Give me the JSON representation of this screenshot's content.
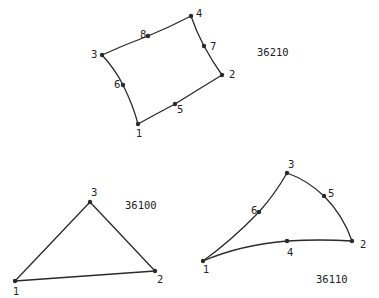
{
  "elements": {
    "quad": {
      "id_label": "36210",
      "shape": "8-node quadrilateral",
      "nodes": [
        "1",
        "2",
        "3",
        "4",
        "5",
        "6",
        "7",
        "8"
      ]
    },
    "tri_linear": {
      "id_label": "36100",
      "shape": "3-node triangle",
      "nodes": [
        "1",
        "2",
        "3"
      ]
    },
    "tri_quadratic": {
      "id_label": "36110",
      "shape": "6-node curved triangle",
      "nodes": [
        "1",
        "2",
        "3",
        "4",
        "5",
        "6"
      ]
    }
  },
  "colors": {
    "stroke": "#2a2a2a",
    "background": "#ffffff"
  }
}
